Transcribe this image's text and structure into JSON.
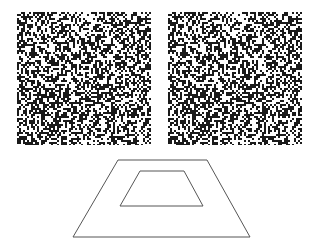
{
  "figure": {
    "background": "#ffffff",
    "dot_color": "#1a1a1a",
    "line_color": "#555555",
    "stereogram": {
      "type": "random-dot stereogram pair",
      "density": 0.5,
      "dot_size_px": 2,
      "seed": 1965,
      "left_image": {
        "x": 17,
        "y": 12,
        "width": 134,
        "height": 133
      },
      "right_image": {
        "x": 168,
        "y": 12,
        "width": 134,
        "height": 133
      },
      "shifted_region": {
        "x": 40,
        "y": 40,
        "width": 54,
        "height": 40,
        "disparity_px": 4
      }
    },
    "trapezoid_diagram": {
      "outer": {
        "points": [
          [
            118,
            160
          ],
          [
            207,
            160
          ],
          [
            250,
            237
          ],
          [
            73,
            237
          ]
        ]
      },
      "inner": {
        "points": [
          [
            140,
            171
          ],
          [
            184,
            171
          ],
          [
            203,
            206
          ],
          [
            120,
            206
          ]
        ]
      }
    }
  }
}
